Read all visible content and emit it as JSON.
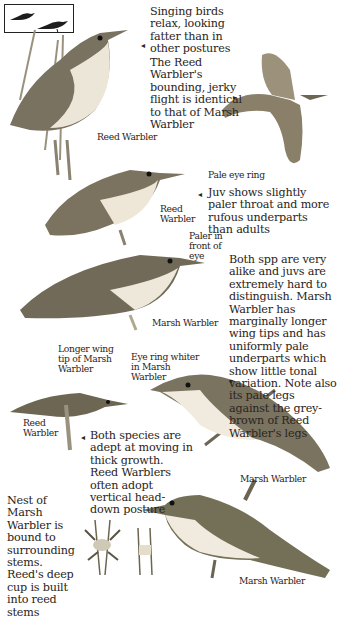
{
  "page": {
    "type": "field-guide-plate"
  },
  "icons": {
    "arrow_left": "◂",
    "arrow_right": "▸",
    "arrow_down": "▾"
  },
  "thumbnail": {
    "description": "silhouettes of two perched warblers"
  },
  "notes": {
    "singing": "Singing birds relax, looking fatter than in other postures",
    "flight": "The Reed Warbler's bounding, jerky flight is identical to that of Marsh Warbler",
    "juv": "Juv shows slightly paler throat and more rufous underparts than adults",
    "comparison": "Both spp are very alike and juvs are extremely hard to distinguish. Marsh Warbler has marginally longer wing tips and has uniformly pale underparts which show little tonal variation. Note also its pale legs against the grey-brown of Reed Warbler's legs",
    "behaviour": "Both species are adept at moving in thick growth. Reed Warblers often adopt vertical head-down posture",
    "nest": "Nest of Marsh Warbler is bound to surrounding stems. Reed's deep cup is built into reed stems"
  },
  "labels": {
    "reed_warbler_1": "Reed Warbler",
    "pale_eye_ring": "Pale eye ring",
    "reed_warbler_2": "Reed Warbler",
    "paler_in_front": "Paler in front of eye",
    "marsh_warbler_1": "Marsh Warbler",
    "longer_wing_tip": "Longer wing tip of Marsh Warbler",
    "eye_ring_whiter": "Eye ring whiter in Marsh Warbler",
    "reed_warbler_3": "Reed Warbler",
    "marsh_warbler_2": "Marsh Warbler",
    "marsh_warbler_3": "Marsh Warbler"
  },
  "colors": {
    "ink": "#2a2420",
    "bird_back": "#6b6452",
    "bird_belly": "#ece7da",
    "reed": "#8a8270"
  }
}
